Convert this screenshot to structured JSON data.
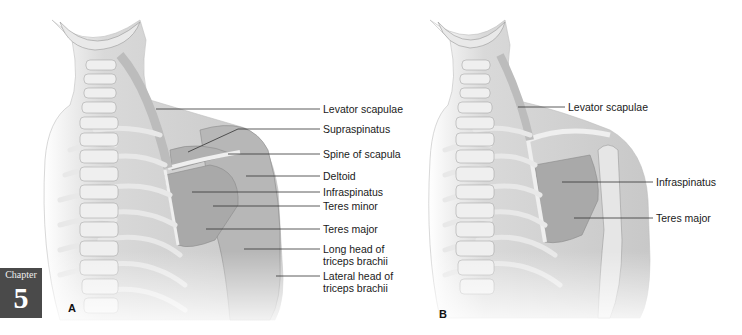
{
  "chapter_tab": {
    "word": "Chapter",
    "number": "5"
  },
  "panel_a": {
    "letter": "A",
    "labels": [
      {
        "text": "Levator scapulae",
        "x": 323,
        "y": 103,
        "line": [
          [
            156,
            109
          ],
          [
            320,
            109
          ]
        ]
      },
      {
        "text": "Supraspinatus",
        "x": 323,
        "y": 123,
        "line": [
          [
            188,
            152
          ],
          [
            238,
            129
          ],
          [
            320,
            129
          ]
        ]
      },
      {
        "text": "Spine of scapula",
        "x": 323,
        "y": 148,
        "line": [
          [
            228,
            154
          ],
          [
            320,
            154
          ]
        ]
      },
      {
        "text": "Deltoid",
        "x": 323,
        "y": 170,
        "line": [
          [
            246,
            176
          ],
          [
            320,
            176
          ]
        ]
      },
      {
        "text": "Infraspinatus",
        "x": 323,
        "y": 186,
        "line": [
          [
            192,
            192
          ],
          [
            320,
            192
          ]
        ]
      },
      {
        "text": "Teres minor",
        "x": 323,
        "y": 200,
        "line": [
          [
            213,
            206
          ],
          [
            320,
            206
          ]
        ]
      },
      {
        "text": "Teres major",
        "x": 323,
        "y": 223,
        "line": [
          [
            206,
            229
          ],
          [
            320,
            229
          ]
        ]
      },
      {
        "text": "Long head of triceps brachii",
        "x": 323,
        "y": 243,
        "line": [
          [
            244,
            249
          ],
          [
            320,
            249
          ]
        ]
      },
      {
        "text": "Lateral head of triceps brachii",
        "x": 323,
        "y": 270,
        "line": [
          [
            276,
            276
          ],
          [
            320,
            276
          ]
        ]
      }
    ]
  },
  "panel_b": {
    "letter": "B",
    "labels": [
      {
        "text": "Levator scapulae",
        "x": 568,
        "y": 101,
        "line": [
          [
            518,
            107
          ],
          [
            565,
            107
          ]
        ]
      },
      {
        "text": "Infraspinatus",
        "x": 656,
        "y": 176,
        "line": [
          [
            562,
            182
          ],
          [
            653,
            182
          ]
        ]
      },
      {
        "text": "Teres major",
        "x": 656,
        "y": 212,
        "line": [
          [
            574,
            218
          ],
          [
            653,
            218
          ]
        ]
      }
    ]
  },
  "colors": {
    "muscle": "#a9a9a9",
    "bone": "#e6e6e6",
    "skin": "#d4d4d4",
    "outline": "#8a8a8a",
    "leader": "#333333"
  }
}
